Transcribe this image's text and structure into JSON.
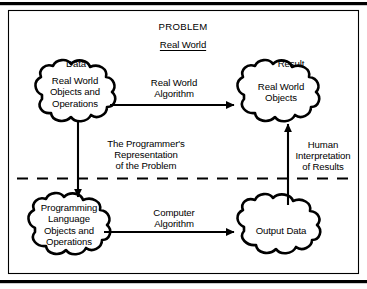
{
  "figure": {
    "title": "PROBLEM",
    "subtitle": "Real World",
    "accent_color": "#000000",
    "background_color": "#ffffff"
  },
  "labels": {
    "data": "Data",
    "result": "Result"
  },
  "nodes": [
    {
      "id": "real-world-objects-and-operations",
      "text": "Real World\nObjects and\nOperations",
      "caption": "Data",
      "shape": "cloud"
    },
    {
      "id": "real-world-objects",
      "text": "Real World\nObjects",
      "caption": "Result",
      "shape": "cloud"
    },
    {
      "id": "programming-language-objects-and-operations",
      "text": "Programming\nLanguage\nObjects and\nOperations",
      "caption": "",
      "shape": "cloud"
    },
    {
      "id": "output-data",
      "text": "Output Data",
      "caption": "",
      "shape": "cloud"
    }
  ],
  "edges": [
    {
      "id": "real-world-algorithm",
      "label": "Real World\nAlgorithm",
      "from": "real-world-objects-and-operations",
      "to": "real-world-objects",
      "direction": "right"
    },
    {
      "id": "programmers-representation",
      "label": "The Programmer's\nRepresentation\nof the Problem",
      "from": "real-world-objects-and-operations",
      "to": "programming-language-objects-and-operations",
      "direction": "down"
    },
    {
      "id": "computer-algorithm",
      "label": "Computer\nAlgorithm",
      "from": "programming-language-objects-and-operations",
      "to": "output-data",
      "direction": "right"
    },
    {
      "id": "human-interpretation",
      "label": "Human\nInterpretation\nof Results",
      "from": "output-data",
      "to": "real-world-objects",
      "direction": "up"
    }
  ],
  "divider": {
    "style": "dashed",
    "label": ""
  }
}
